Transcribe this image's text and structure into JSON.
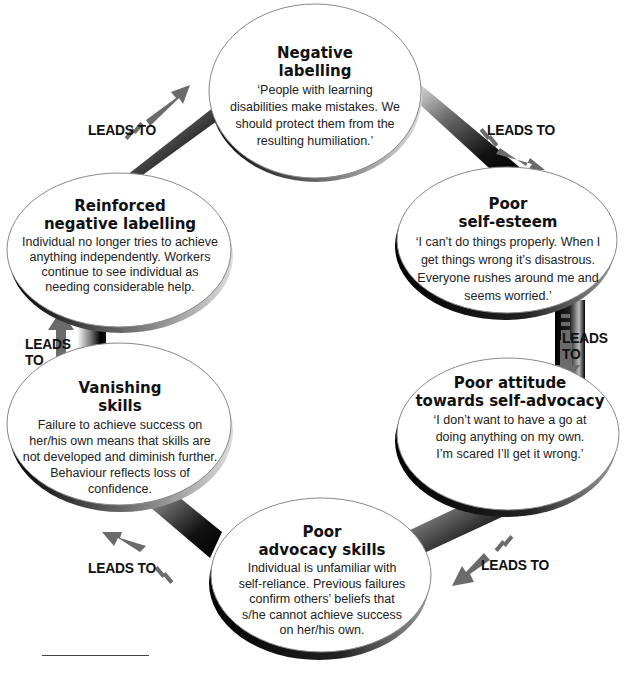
{
  "diagram": {
    "type": "cycle",
    "connector_label": "LEADS TO",
    "colors": {
      "ellipse_fill": "#ffffff",
      "ellipse_outline": "#888888",
      "connector_dark": "#111111",
      "arrow_gray": "#6b6b6b",
      "text": "#1a1a1a"
    },
    "nodes": [
      {
        "id": "negative-labelling",
        "title_line1": "Negative",
        "title_line2": "labelling",
        "body": "‘People with learning disabilities make mistakes. We should protect them from the resulting humiliation.’"
      },
      {
        "id": "poor-self-esteem",
        "title_line1": "Poor",
        "title_line2": "self-esteem",
        "body": "‘I can’t do things properly. When I get things wrong it’s disastrous. Everyone rushes around me and seems worried.’"
      },
      {
        "id": "poor-attitude-self-advocacy",
        "title_line1": "Poor attitude",
        "title_line2": "towards self-advocacy",
        "body": "‘I don’t want to have a go at doing anything on my own. I’m scared I’ll get it wrong.’"
      },
      {
        "id": "poor-advocacy-skills",
        "title_line1": "Poor",
        "title_line2": "advocacy skills",
        "body": "Individual is unfamiliar with self-reliance. Previous failures confirm others’ beliefs that s/he cannot achieve success on her/his own."
      },
      {
        "id": "vanishing-skills",
        "title_line1": "Vanishing",
        "title_line2": "skills",
        "body": "Failure to achieve success on her/his own means that skills are not developed and diminish further. Behaviour reflects loss of confidence."
      },
      {
        "id": "reinforced-negative-labelling",
        "title_line1": "Reinforced",
        "title_line2": "negative labelling",
        "body": "Individual no longer tries to achieve anything independently. Workers continue to see individual as needing considerable help."
      }
    ],
    "connectors": [
      {
        "from": "reinforced-negative-labelling",
        "to": "negative-labelling",
        "label": "LEADS TO"
      },
      {
        "from": "negative-labelling",
        "to": "poor-self-esteem",
        "label": "LEADS TO"
      },
      {
        "from": "poor-self-esteem",
        "to": "poor-attitude-self-advocacy",
        "label_line1": "LEADS",
        "label_line2": "TO"
      },
      {
        "from": "poor-attitude-self-advocacy",
        "to": "poor-advocacy-skills",
        "label": "LEADS TO"
      },
      {
        "from": "poor-advocacy-skills",
        "to": "vanishing-skills",
        "label": "LEADS TO"
      },
      {
        "from": "vanishing-skills",
        "to": "reinforced-negative-labelling",
        "label_line1": "LEADS",
        "label_line2": "TO"
      }
    ]
  }
}
